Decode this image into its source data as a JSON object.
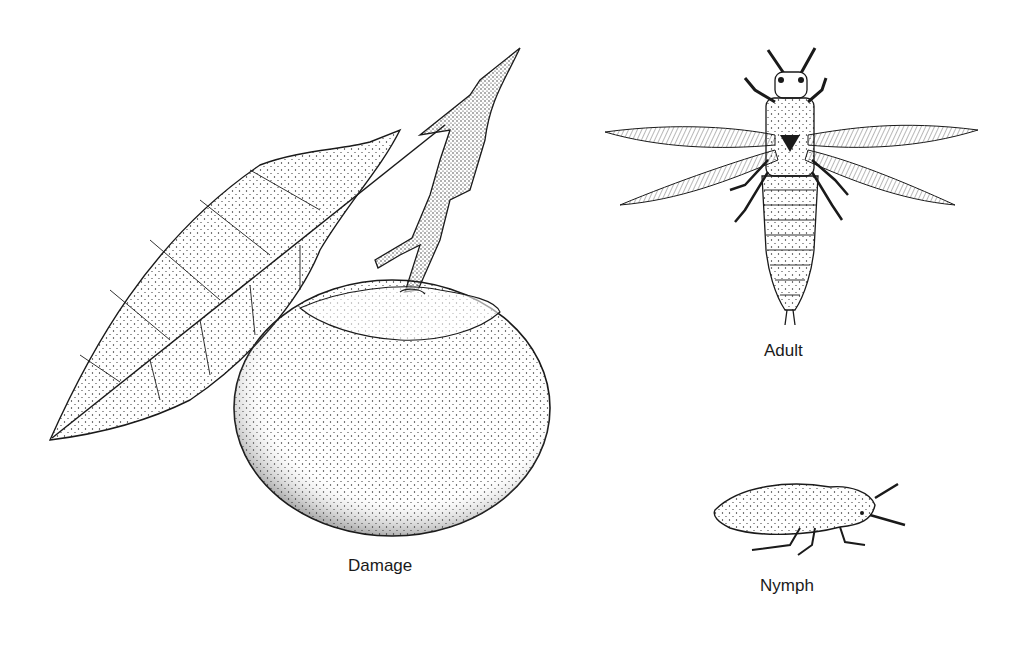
{
  "figure": {
    "panels": [
      {
        "id": "damage",
        "label": "Damage",
        "subject": "citrus fruit with leaf and stem showing scarring ring around stem end"
      },
      {
        "id": "adult",
        "label": "Adult",
        "subject": "winged thrips adult, dorsal view, fringed wings spread"
      },
      {
        "id": "nymph",
        "label": "Nymph",
        "subject": "wingless thrips nymph, lateral view"
      }
    ]
  },
  "colors": {
    "ink": "#1a1a1a",
    "background": "#ffffff"
  }
}
